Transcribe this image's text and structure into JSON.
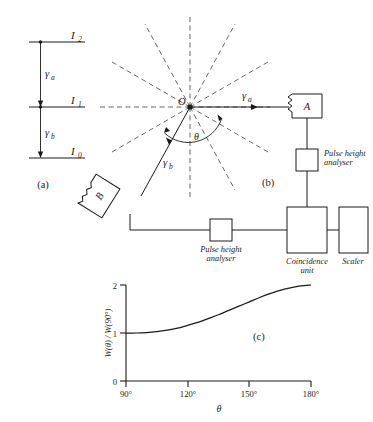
{
  "figure": {
    "panels": {
      "a_label": "(a)",
      "b_label": "(b)",
      "c_label": "(c)"
    },
    "level_diagram": {
      "levels": [
        {
          "id": "I2",
          "name": "I",
          "sub": "2"
        },
        {
          "id": "I1",
          "name": "I",
          "sub": "1"
        },
        {
          "id": "I0",
          "name": "I",
          "sub": "0"
        }
      ],
      "transitions": [
        {
          "id": "gamma_a",
          "name": "γ",
          "sub": "a"
        },
        {
          "id": "gamma_b",
          "name": "γ",
          "sub": "b"
        }
      ]
    },
    "apparatus": {
      "origin_label": "O",
      "angle_label": "θ",
      "ray_a": {
        "name": "γ",
        "sub": "a"
      },
      "ray_b": {
        "name": "γ",
        "sub": "b"
      },
      "detector_a": "A",
      "detector_b": "B",
      "pulse_height_analyser": {
        "line1": "Pulse height",
        "line2": "analyser"
      },
      "coincidence_unit": {
        "line1": "Coincidence",
        "line2": "unit"
      },
      "scaler": "Scaler"
    },
    "colors": {
      "ink": "#1a1a1a",
      "dashed": "#555555",
      "background": "#ffffff"
    }
  },
  "chart_data": {
    "type": "line",
    "title": "",
    "xlabel": "θ",
    "ylabel": "W(θ) / W(90°)",
    "ylabel_parts": {
      "w": "W",
      "theta": "(θ)",
      "slash": " / ",
      "w2": "W",
      "ninety": "(90°)"
    },
    "xlim": [
      90,
      180
    ],
    "ylim": [
      0,
      2
    ],
    "xticks": [
      90,
      120,
      150,
      180
    ],
    "xtick_labels": [
      "90°",
      "120°",
      "150°",
      "180°"
    ],
    "yticks": [
      0,
      1,
      2
    ],
    "ytick_labels": [
      "0",
      "1",
      "2"
    ],
    "grid": false,
    "legend": null,
    "series": [
      {
        "name": "W(θ)/W(90°)",
        "x": [
          90,
          95,
          100,
          105,
          110,
          115,
          120,
          125,
          130,
          135,
          140,
          145,
          150,
          155,
          160,
          165,
          170,
          175,
          180
        ],
        "y": [
          1.0,
          1.0,
          1.01,
          1.03,
          1.06,
          1.1,
          1.16,
          1.22,
          1.3,
          1.38,
          1.47,
          1.56,
          1.65,
          1.74,
          1.82,
          1.89,
          1.94,
          1.98,
          2.0
        ]
      }
    ]
  }
}
